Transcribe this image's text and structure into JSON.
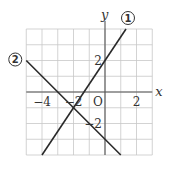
{
  "chart_data": {
    "type": "line",
    "title": "",
    "xlabel": "x",
    "ylabel": "y",
    "origin_label": "O",
    "xlim": [
      -5,
      3
    ],
    "ylim": [
      -4,
      4
    ],
    "grid": true,
    "x_ticks": [
      {
        "value": -4,
        "label": "−4"
      },
      {
        "value": -2,
        "label": "−2"
      },
      {
        "value": 2,
        "label": "2"
      }
    ],
    "y_ticks": [
      {
        "value": 2,
        "label": "2"
      },
      {
        "value": -2,
        "label": "−2"
      }
    ],
    "series": [
      {
        "name": "①",
        "label_text": "1",
        "equation": "y = 3/2 x + 2",
        "slope": 1.5,
        "intercept": 2,
        "x": [
          -4,
          1.333
        ],
        "y": [
          -4,
          4
        ],
        "label_position": "top-end"
      },
      {
        "name": "②",
        "label_text": "2",
        "equation": "y = -x - 3",
        "slope": -1,
        "intercept": -3,
        "x": [
          -5,
          1
        ],
        "y": [
          2,
          -4
        ],
        "label_position": "left-start"
      }
    ]
  }
}
